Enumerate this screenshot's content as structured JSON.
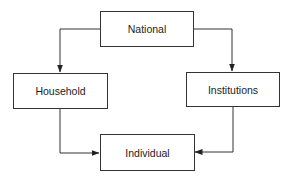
{
  "diagram": {
    "type": "flow",
    "nodes": {
      "national": {
        "label": "National"
      },
      "household": {
        "label": "Household"
      },
      "institutions": {
        "label": "Institutions"
      },
      "individual": {
        "label": "Individual"
      }
    },
    "edges": [
      {
        "from": "National",
        "to": "Household"
      },
      {
        "from": "National",
        "to": "Institutions"
      },
      {
        "from": "Household",
        "to": "Individual"
      },
      {
        "from": "Institutions",
        "to": "Individual"
      }
    ],
    "colors": {
      "line": "#333333",
      "text": "#222222",
      "background": "#ffffff"
    }
  }
}
